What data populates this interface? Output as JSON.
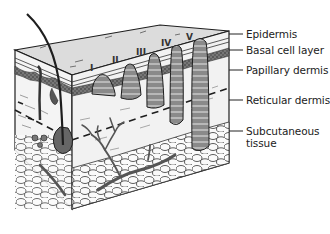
{
  "diagram": {
    "type": "anatomical-cross-section",
    "colors": {
      "outline": "#1e1e1e",
      "epidermis_fill": "#d4d4d4",
      "top_surface": "#dcdcdc",
      "basal_layer": "#6e6e6e",
      "papillary_dermis": "#eeeeee",
      "reticular_dermis": "#f2f2f2",
      "subcutaneous_fill": "#fafafa",
      "tumor_fill": "#8a8a8a",
      "tumor_stripe": "#b4b4b4",
      "vessel": "#555555",
      "background": "#ffffff"
    },
    "levels": [
      {
        "id": "I",
        "label": "I"
      },
      {
        "id": "II",
        "label": "II"
      },
      {
        "id": "III",
        "label": "III"
      },
      {
        "id": "IV",
        "label": "IV"
      },
      {
        "id": "V",
        "label": "V"
      }
    ],
    "layer_labels": [
      {
        "id": "epidermis",
        "label": "Epidermis"
      },
      {
        "id": "basal",
        "label": "Basal cell layer"
      },
      {
        "id": "papillary",
        "label": "Papillary dermis"
      },
      {
        "id": "reticular",
        "label": "Reticular dermis"
      },
      {
        "id": "subcutaneous_1",
        "label": "Subcutaneous"
      },
      {
        "id": "subcutaneous_2",
        "label": "tissue"
      }
    ]
  }
}
